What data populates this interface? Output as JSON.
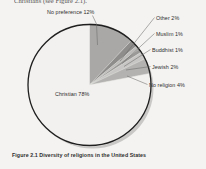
{
  "page": {
    "body_text_line": "Christians (see Figure 2.1).",
    "background_color": "#f4f3f1"
  },
  "caption": {
    "text": "Figure 2.1 Diversity of religions in the United States"
  },
  "chart_data": {
    "type": "pie",
    "title": "Figure 2.1 Diversity of religions in the United States",
    "unit": "%",
    "start_angle_deg": 0,
    "direction": "clockwise",
    "legend": "none",
    "labels_position": "callout",
    "categories": [
      "No preference",
      "Other",
      "Muslim",
      "Buddhist",
      "Jewish",
      "No religion",
      "Christian"
    ],
    "values": [
      12,
      2,
      1,
      1,
      2,
      4,
      78
    ],
    "slices": [
      {
        "name": "No preference",
        "value": 12,
        "label": "No preference 12%",
        "color": "#a9a8a6"
      },
      {
        "name": "Other",
        "value": 2,
        "label": "Other 2%",
        "color": "#8e8d8b"
      },
      {
        "name": "Muslim",
        "value": 1,
        "label": "Muslim 1%",
        "color": "#bcbbb9"
      },
      {
        "name": "Buddhist",
        "value": 1,
        "label": "Buddhist 1%",
        "color": "#9a9997"
      },
      {
        "name": "Jewish",
        "value": 2,
        "label": "Jewish 2%",
        "color": "#c7c6c4"
      },
      {
        "name": "No religion",
        "value": 4,
        "label": "No religion 4%",
        "color": "#b3b2b0"
      },
      {
        "name": "Christian",
        "value": 78,
        "label": "Christian 78%",
        "color": "#f3f1ef"
      }
    ],
    "outline_color": "#1f1f1f",
    "shadow_color": "#c9c7c5"
  }
}
